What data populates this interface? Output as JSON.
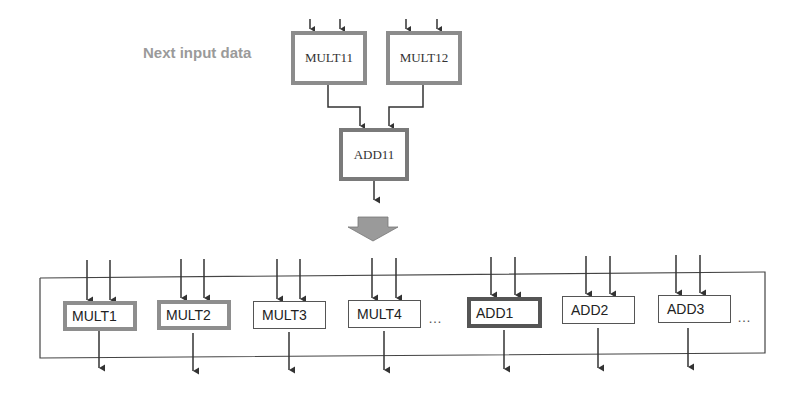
{
  "diagram": {
    "annotation": "Next input data",
    "top_units": [
      {
        "id": "MULT11",
        "label": "MULT11",
        "type": "multiplier"
      },
      {
        "id": "MULT12",
        "label": "MULT12",
        "type": "multiplier"
      },
      {
        "id": "ADD11",
        "label": "ADD11",
        "type": "adder"
      }
    ],
    "top_connections": [
      {
        "from": "MULT11",
        "to": "ADD11"
      },
      {
        "from": "MULT12",
        "to": "ADD11"
      }
    ],
    "transition_arrow": "block-arrow-down",
    "bottom_units": [
      {
        "label": "MULT1",
        "highlight": "gray"
      },
      {
        "label": "MULT2",
        "highlight": "gray"
      },
      {
        "label": "MULT3",
        "highlight": "none"
      },
      {
        "label": "MULT4",
        "highlight": "none"
      },
      {
        "label": "ADD1",
        "highlight": "dark"
      },
      {
        "label": "ADD2",
        "highlight": "none"
      },
      {
        "label": "ADD3",
        "highlight": "none"
      }
    ],
    "ellipsis": [
      "…",
      "…"
    ],
    "colors": {
      "annotation_text": "#9a9a9a",
      "highlight_gray": "#8e8e8e",
      "highlight_dark": "#555555",
      "line": "#333333",
      "block_arrow": "#9a9a9a"
    }
  }
}
